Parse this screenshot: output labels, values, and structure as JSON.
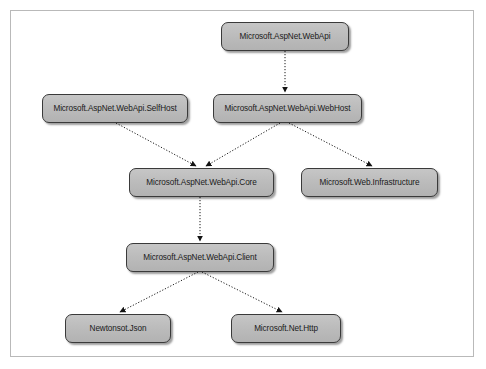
{
  "diagram": {
    "background_color": "#ffffff",
    "frame_color": "#b9b9b9",
    "node_fill_color": "#bcbcbc",
    "node_border_color": "#3a3a3a",
    "edge_color": "#1a1a1a",
    "edge_style": "dotted",
    "arrowhead": "filled-triangle",
    "nodes": [
      {
        "id": "webapi",
        "label": "Microsoft.AspNet.WebApi",
        "x": 221,
        "y": 22,
        "w": 128,
        "h": 29
      },
      {
        "id": "selfhost",
        "label": "Microsoft.AspNet.WebApi.SelfHost",
        "x": 42,
        "y": 94,
        "w": 146,
        "h": 29
      },
      {
        "id": "webhost",
        "label": "Microsoft.AspNet.WebApi.WebHost",
        "x": 213,
        "y": 94,
        "w": 149,
        "h": 29
      },
      {
        "id": "core",
        "label": "Microsoft.AspNet.WebApi.Core",
        "x": 129,
        "y": 168,
        "w": 145,
        "h": 29
      },
      {
        "id": "infrastructure",
        "label": "Microsoft.Web.Infrastructure",
        "x": 301,
        "y": 168,
        "w": 137,
        "h": 29
      },
      {
        "id": "client",
        "label": "Microsoft.AspNet.WebApi.Client",
        "x": 126,
        "y": 243,
        "w": 148,
        "h": 29
      },
      {
        "id": "json",
        "label": "Newtonsot.Json",
        "x": 65,
        "y": 314,
        "w": 106,
        "h": 29
      },
      {
        "id": "http",
        "label": "Microsoft.Net.Http",
        "x": 231,
        "y": 314,
        "w": 110,
        "h": 29
      }
    ],
    "edges": [
      {
        "id": "webapi-to-webhost",
        "from": "webapi",
        "to": "webhost",
        "x1": 285,
        "y1": 51,
        "x2": 285,
        "y2": 92
      },
      {
        "id": "selfhost-to-core",
        "from": "selfhost",
        "to": "core",
        "x1": 116,
        "y1": 123,
        "x2": 196,
        "y2": 166
      },
      {
        "id": "webhost-to-core",
        "from": "webhost",
        "to": "core",
        "x1": 280,
        "y1": 123,
        "x2": 206,
        "y2": 166
      },
      {
        "id": "webhost-to-infrastructure",
        "from": "webhost",
        "to": "infrastructure",
        "x1": 289,
        "y1": 123,
        "x2": 372,
        "y2": 166
      },
      {
        "id": "core-to-client",
        "from": "core",
        "to": "client",
        "x1": 200,
        "y1": 197,
        "x2": 200,
        "y2": 241
      },
      {
        "id": "client-to-json",
        "from": "client",
        "to": "json",
        "x1": 198,
        "y1": 272,
        "x2": 120,
        "y2": 312
      },
      {
        "id": "client-to-http",
        "from": "client",
        "to": "http",
        "x1": 202,
        "y1": 272,
        "x2": 282,
        "y2": 312
      }
    ]
  }
}
